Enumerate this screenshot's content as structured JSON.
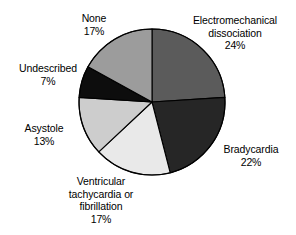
{
  "chart_data": {
    "type": "pie",
    "title": "",
    "subtitle": "",
    "xlabel": "",
    "ylabel": "",
    "legend_position": "none",
    "grid": false,
    "labels_outside": true,
    "start_angle_deg": 0,
    "direction": "clockwise",
    "units": "percent",
    "total": 100,
    "categories": [
      "Electromechanical dissociation",
      "Bradycardia",
      "Ventricular tachycardia or fibrillation",
      "Asystole",
      "Undescribed",
      "None"
    ],
    "values": [
      24,
      22,
      17,
      13,
      7,
      17
    ],
    "slices": [
      {
        "name": "Electromechanical dissociation",
        "label_lines": [
          "Electromechanical",
          "dissociation"
        ],
        "value": 24,
        "percent_text": "24%",
        "color": "#5b5b5b"
      },
      {
        "name": "Bradycardia",
        "label_lines": [
          "Bradycardia"
        ],
        "value": 22,
        "percent_text": "22%",
        "color": "#262626"
      },
      {
        "name": "Ventricular tachycardia or fibrillation",
        "label_lines": [
          "Ventricular",
          "tachycardia or",
          "fibrillation"
        ],
        "value": 17,
        "percent_text": "17%",
        "color": "#e9e9e9"
      },
      {
        "name": "Asystole",
        "label_lines": [
          "Asystole"
        ],
        "value": 13,
        "percent_text": "13%",
        "color": "#cdcdcd"
      },
      {
        "name": "Undescribed",
        "label_lines": [
          "Undescribed"
        ],
        "value": 7,
        "percent_text": "7%",
        "color": "#0d0d0d"
      },
      {
        "name": "None",
        "label_lines": [
          "None"
        ],
        "value": 17,
        "percent_text": "17%",
        "color": "#9c9c9c"
      }
    ],
    "outline_color": "#000000",
    "background": "#ffffff"
  },
  "labels": {
    "none": {
      "line1": "None",
      "pct": "17%"
    },
    "emd": {
      "line1": "Electromechanical",
      "line2": "dissociation",
      "pct": "24%"
    },
    "bradycardia": {
      "line1": "Bradycardia",
      "pct": "22%"
    },
    "vtach": {
      "line1": "Ventricular",
      "line2": "tachycardia or",
      "line3": "fibrillation",
      "pct": "17%"
    },
    "asystole": {
      "line1": "Asystole",
      "pct": "13%"
    },
    "undescribed": {
      "line1": "Undescribed",
      "pct": "7%"
    }
  }
}
